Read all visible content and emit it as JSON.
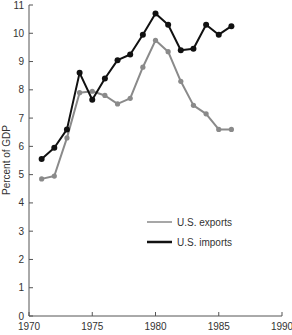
{
  "chart_data": {
    "type": "line",
    "title": "",
    "xlabel": "",
    "ylabel": "Percent of GDP",
    "xlim": [
      1970,
      1990
    ],
    "ylim": [
      0,
      11
    ],
    "xticks": [
      1970,
      1975,
      1980,
      1985,
      1990
    ],
    "yticks": [
      0,
      1,
      2,
      3,
      4,
      5,
      6,
      7,
      8,
      9,
      10,
      11
    ],
    "grid": false,
    "legend_position": "center-right",
    "x": [
      1971,
      1972,
      1973,
      1974,
      1975,
      1976,
      1977,
      1978,
      1979,
      1980,
      1981,
      1982,
      1983,
      1984,
      1985,
      1986
    ],
    "series": [
      {
        "name": "U.S. exports",
        "color": "#8a8a8a",
        "values": [
          4.85,
          4.95,
          6.3,
          7.9,
          7.95,
          7.8,
          7.5,
          7.7,
          8.8,
          9.75,
          9.35,
          8.3,
          7.45,
          7.15,
          6.6,
          6.6
        ]
      },
      {
        "name": "U.S. imports",
        "color": "#111111",
        "values": [
          5.55,
          5.95,
          6.6,
          8.6,
          7.65,
          8.4,
          9.05,
          9.25,
          9.95,
          10.7,
          10.3,
          9.4,
          9.45,
          10.3,
          9.95,
          10.25
        ]
      }
    ]
  }
}
